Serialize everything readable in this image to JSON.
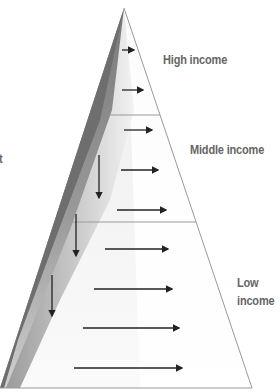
{
  "diagram": {
    "tiers": [
      {
        "id": "high",
        "label": "High income"
      },
      {
        "id": "middle",
        "label": "Middle income"
      },
      {
        "id": "low",
        "label_line1": "Low",
        "label_line2": "income"
      }
    ],
    "cropped_left_text": "t",
    "colors": {
      "shadow_dark": "#6e6e6e",
      "shadow_mid": "#a8a8a8",
      "face_light": "#f4f4f4",
      "outline": "#9a9a9a",
      "arrow": "#222222",
      "label": "#666666"
    },
    "arrows": {
      "horizontal": [
        {
          "tier": "high",
          "x1": 122,
          "x2": 136,
          "y": 50
        },
        {
          "tier": "high",
          "x1": 122,
          "x2": 145,
          "y": 90
        },
        {
          "tier": "middle",
          "x1": 124,
          "x2": 154,
          "y": 130
        },
        {
          "tier": "middle",
          "x1": 121,
          "x2": 160,
          "y": 170
        },
        {
          "tier": "middle",
          "x1": 117,
          "x2": 168,
          "y": 210
        },
        {
          "tier": "low",
          "x1": 105,
          "x2": 170,
          "y": 249
        },
        {
          "tier": "low",
          "x1": 94,
          "x2": 174,
          "y": 289
        },
        {
          "tier": "low",
          "x1": 83,
          "x2": 181,
          "y": 328
        },
        {
          "tier": "low",
          "x1": 74,
          "x2": 184,
          "y": 368
        }
      ],
      "vertical": [
        {
          "x": 99,
          "y1": 155,
          "y2": 200
        },
        {
          "x": 76,
          "y1": 214,
          "y2": 258
        },
        {
          "x": 52,
          "y1": 275,
          "y2": 318
        }
      ]
    }
  }
}
